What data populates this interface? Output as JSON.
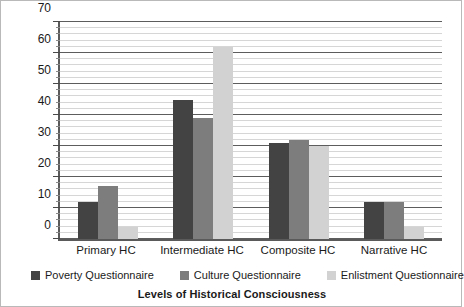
{
  "chart_data": {
    "type": "bar",
    "title": "",
    "subtitle": "",
    "xlabel": "Levels of Historical Consciousness",
    "ylabel": "% of student sample",
    "categories": [
      "Primary HC",
      "Intermediate HC",
      "Composite HC",
      "Narrative HC"
    ],
    "series": [
      {
        "name": "Poverty Questionnaire",
        "color": "#434343",
        "values": [
          12,
          45,
          31,
          12
        ]
      },
      {
        "name": "Culture Questionnaire",
        "color": "#7d7d7d",
        "values": [
          17,
          39,
          32,
          12
        ]
      },
      {
        "name": "Enlistment Questionnaire",
        "color": "#d2d2d2",
        "values": [
          4,
          62,
          30,
          4
        ]
      }
    ],
    "ylim": [
      0,
      70
    ],
    "ytick_labels": [
      "0",
      "10",
      "20",
      "30",
      "40",
      "50",
      "60",
      "70"
    ],
    "ytick_values": [
      0,
      10,
      20,
      30,
      40,
      50,
      60,
      70
    ],
    "y_major_step": 10,
    "y_minor_step": 2,
    "grid": true,
    "grid_axis": "y",
    "legend_position": "bottom",
    "legend_entries": [
      "Poverty Questionnaire",
      "Culture Questionnaire",
      "Enlistment Questionnaire"
    ],
    "annotations": []
  }
}
